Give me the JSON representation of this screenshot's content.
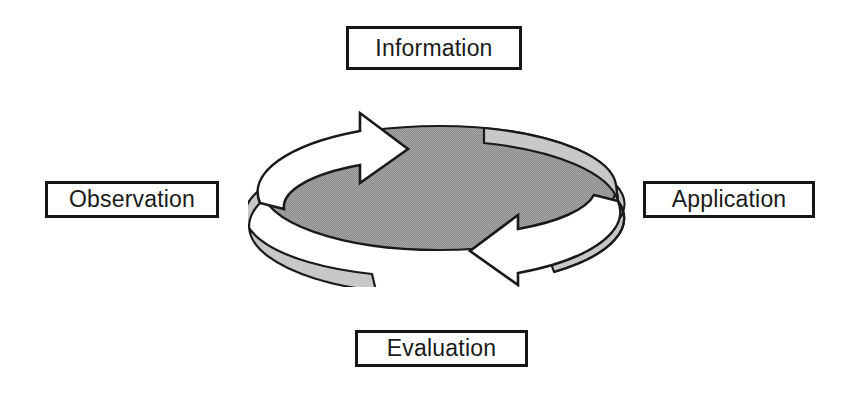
{
  "page": {
    "background_color": "#ffffff",
    "width": 857,
    "height": 397
  },
  "diagram": {
    "name": "four-stage-cycle",
    "type": "cycle",
    "direction": "clockwise",
    "center_graphic": {
      "name": "circular-arrow-cycle-graphic",
      "shape": "3d-ring-with-two-arrows",
      "disc_fill_color": "#9a9a9a",
      "side_wall_color": "#c9c9c9",
      "arrow_fill_color": "#ffffff",
      "outline_color": "#1a1a1a",
      "arrows": [
        {
          "name": "top-left-arrow",
          "points": "right"
        },
        {
          "name": "bottom-right-arrow",
          "points": "left"
        }
      ]
    },
    "stages": [
      {
        "id": "information",
        "label": "Information",
        "position": "top"
      },
      {
        "id": "application",
        "label": "Application",
        "position": "right"
      },
      {
        "id": "evaluation",
        "label": "Evaluation",
        "position": "bottom"
      },
      {
        "id": "observation",
        "label": "Observation",
        "position": "left"
      }
    ],
    "box_style": {
      "border_color": "#161616",
      "fill_color": "#ffffff",
      "text_color": "#1a1a1a"
    }
  }
}
